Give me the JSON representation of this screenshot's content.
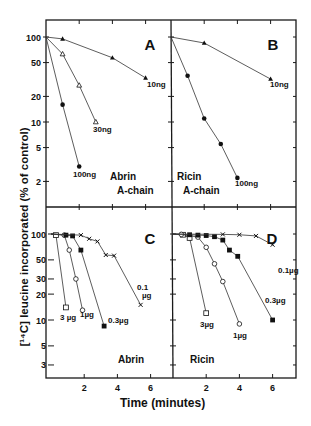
{
  "figure": {
    "ylabel": "[¹⁴C] leucine incorporated  (% of control)",
    "xlabel": "Time (minutes)"
  },
  "chart_data": [
    {
      "type": "line",
      "panel": "A",
      "title": "Abrin A-chain",
      "xlabel": "Time (minutes)",
      "ylabel": "[14C] leucine incorporated (% of control)",
      "yscale": "log",
      "ylim": [
        1.3,
        130
      ],
      "xlim": [
        0,
        7.5
      ],
      "yticks": [
        100,
        50,
        20,
        10,
        5,
        2
      ],
      "xticks": [
        2,
        4,
        6
      ],
      "series": [
        {
          "name": "10 ng",
          "marker": "filled-triangle",
          "x": [
            0,
            1,
            4,
            6
          ],
          "y": [
            100,
            95,
            57,
            33
          ]
        },
        {
          "name": "30 ng",
          "marker": "open-triangle",
          "x": [
            0,
            1,
            2,
            3
          ],
          "y": [
            100,
            63,
            27,
            10
          ]
        },
        {
          "name": "100 ng",
          "marker": "filled-circle",
          "x": [
            0,
            1,
            2
          ],
          "y": [
            100,
            16,
            3
          ]
        }
      ]
    },
    {
      "type": "line",
      "panel": "B",
      "title": "Ricin A-chain",
      "xlabel": "Time (minutes)",
      "ylabel": "[14C] leucine incorporated (% of control)",
      "yscale": "log",
      "ylim": [
        1.3,
        130
      ],
      "xlim": [
        0,
        7.5
      ],
      "yticks": [
        100,
        50,
        20,
        10,
        5,
        2
      ],
      "xticks": [
        2,
        4,
        6
      ],
      "series": [
        {
          "name": "10 ng",
          "marker": "filled-triangle",
          "x": [
            0,
            2,
            6
          ],
          "y": [
            100,
            85,
            32
          ]
        },
        {
          "name": "100 ng",
          "marker": "filled-circle",
          "x": [
            0,
            1,
            2,
            3,
            4
          ],
          "y": [
            100,
            35,
            11,
            5.5,
            2.2
          ]
        }
      ]
    },
    {
      "type": "line",
      "panel": "C",
      "title": "Abrin",
      "xlabel": "Time (minutes)",
      "ylabel": "[14C] leucine incorporated (% of control)",
      "yscale": "log",
      "ylim": [
        2.2,
        130
      ],
      "xlim": [
        0,
        7.5
      ],
      "yticks": [
        100,
        50,
        30,
        20,
        10,
        5,
        3
      ],
      "xticks": [
        2,
        4,
        6
      ],
      "series": [
        {
          "name": "3 µg",
          "marker": "open-square",
          "x": [
            0,
            0.3,
            0.9
          ],
          "y": [
            100,
            97,
            14
          ]
        },
        {
          "name": "1 µg",
          "marker": "open-circle",
          "x": [
            0,
            0.8,
            1.1,
            1.5,
            1.9
          ],
          "y": [
            100,
            97,
            65,
            30,
            13
          ]
        },
        {
          "name": "0.3 µg",
          "marker": "filled-square",
          "x": [
            0,
            0.9,
            1.3,
            1.8,
            3.2
          ],
          "y": [
            100,
            97,
            95,
            65,
            8.5
          ]
        },
        {
          "name": "0.1 µg",
          "marker": "cross",
          "x": [
            0,
            1.8,
            2.3,
            2.8,
            3.3,
            3.8,
            5.4
          ],
          "y": [
            100,
            97,
            88,
            82,
            57,
            56,
            15
          ]
        }
      ]
    },
    {
      "type": "line",
      "panel": "D",
      "title": "Ricin",
      "xlabel": "Time (minutes)",
      "ylabel": "[14C] leucine incorporated (% of control)",
      "yscale": "log",
      "ylim": [
        2.2,
        130
      ],
      "xlim": [
        0,
        7.5
      ],
      "yticks": [
        100,
        50,
        30,
        20,
        10,
        5,
        3
      ],
      "xticks": [
        2,
        4,
        6
      ],
      "series": [
        {
          "name": "3µg",
          "marker": "open-square",
          "x": [
            0,
            0.6,
            1,
            2
          ],
          "y": [
            100,
            98,
            90,
            12
          ]
        },
        {
          "name": "1µg",
          "marker": "open-circle",
          "x": [
            0,
            0.5,
            1.5,
            2,
            2.5,
            3,
            4
          ],
          "y": [
            100,
            99,
            92,
            70,
            45,
            28,
            9
          ]
        },
        {
          "name": "0.3µg",
          "marker": "filled-square",
          "x": [
            0,
            1,
            1.5,
            2,
            2.5,
            3,
            3.4,
            3.9,
            6
          ],
          "y": [
            100,
            98,
            97,
            96,
            93,
            85,
            65,
            55,
            10
          ]
        },
        {
          "name": "0.1µg",
          "marker": "cross",
          "x": [
            0,
            3,
            4,
            5,
            6
          ],
          "y": [
            100,
            99,
            98,
            95,
            75
          ]
        }
      ]
    }
  ],
  "panels": [
    {
      "letter": "A",
      "name_line1": "Abrin",
      "name_line2": "A-chain",
      "labels": [
        {
          "text": "10ng",
          "series": 0
        },
        {
          "text": "30ng",
          "series": 1
        },
        {
          "text": "100ng",
          "series": 2
        }
      ]
    },
    {
      "letter": "B",
      "name_line1": "Ricin",
      "name_line2": "A-chain",
      "labels": [
        {
          "text": "10ng",
          "series": 0
        },
        {
          "text": "100ng",
          "series": 1
        }
      ]
    },
    {
      "letter": "C",
      "name_line1": "Abrin",
      "name_line2": "",
      "labels": [
        {
          "text": "3 µg",
          "series": 0
        },
        {
          "text": "1µg",
          "series": 1
        },
        {
          "text": "0.3µg",
          "series": 2
        },
        {
          "text": "0.1 µg",
          "series": 3
        }
      ]
    },
    {
      "letter": "D",
      "name_line1": "Ricin",
      "name_line2": "",
      "labels": [
        {
          "text": "3µg",
          "series": 0
        },
        {
          "text": "1µg",
          "series": 1
        },
        {
          "text": "0.3µg",
          "series": 2
        },
        {
          "text": "0.1µg",
          "series": 3
        }
      ]
    }
  ]
}
